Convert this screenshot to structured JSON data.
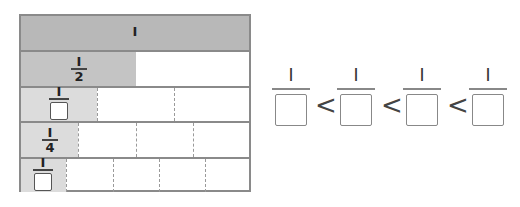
{
  "fraction_bars": {
    "rows": [
      {
        "label_numerator": "I",
        "label_denominator": "",
        "parts": 1,
        "denominator_blank": false,
        "whole": true
      },
      {
        "label_numerator": "I",
        "label_denominator": "2",
        "parts": 2,
        "denominator_blank": false
      },
      {
        "label_numerator": "I",
        "label_denominator": "",
        "parts": 3,
        "denominator_blank": true
      },
      {
        "label_numerator": "I",
        "label_denominator": "4",
        "parts": 4,
        "denominator_blank": false
      },
      {
        "label_numerator": "I",
        "label_denominator": "",
        "parts": 5,
        "denominator_blank": true
      }
    ]
  },
  "comparison": {
    "numerators": [
      "I",
      "I",
      "I",
      "I"
    ],
    "operators": [
      "<",
      "<",
      "<"
    ]
  },
  "colors": {
    "border": "#8a8a8a",
    "shade_whole": "#b8b8b8",
    "shade_half": "#c4c4c4",
    "shade_light": "#dcdcdc"
  }
}
